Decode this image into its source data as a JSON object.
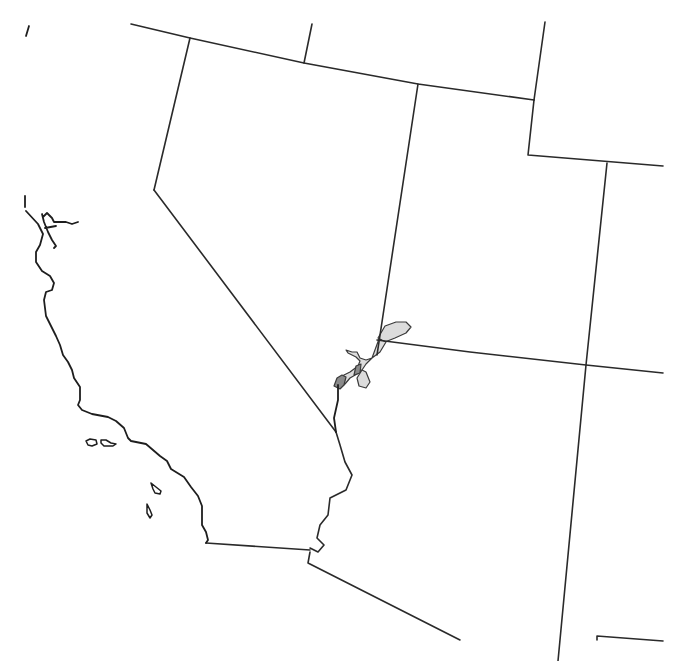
{
  "map": {
    "title": "",
    "width": 679,
    "height": 661,
    "colors": {
      "background": "#ffffff",
      "border": "#2a2a2a",
      "range_light": "#dcdcdc",
      "range_dark": "#8a8a8a"
    },
    "layers": {
      "state_borders": [
        {
          "name": "northern-border-line",
          "d": "M131,24 L190,38 L304,63 L418,84 L534,100"
        },
        {
          "name": "oregon-idaho-border",
          "d": "M312,24 L304,63"
        },
        {
          "name": "idaho-wyoming-border",
          "d": "M545,22 L534,100"
        },
        {
          "name": "california-nevada-north-border",
          "d": "M190,38 L154,190"
        },
        {
          "name": "california-nevada-diagonal-border",
          "d": "M154,190 L336,432"
        },
        {
          "name": "nevada-utah-border",
          "d": "M418,84 L377,355"
        },
        {
          "name": "utah-wyoming-border",
          "d": "M534,100 L528,155 L663,166"
        },
        {
          "name": "utah-colorado-border",
          "d": "M607,163 L586,365 L558,661"
        },
        {
          "name": "arizona-utah-border",
          "d": "M377,340 L470,352 L586,365 L663,373"
        },
        {
          "name": "california-arizona-border",
          "d": "M336,432 L340,445 L345,462 L352,475 L346,490 L330,498 L328,515 L320,525 L317,538 L324,545 L318,552 L310,548"
        },
        {
          "name": "california-mexico-border",
          "d": "M206,543 L310,550"
        },
        {
          "name": "arizona-mexico-border",
          "d": "M310,552 L308,563 L460,640"
        },
        {
          "name": "new-mexico-mexico-border",
          "d": "M597,640 L597,636 L663,641"
        }
      ],
      "coastline": [
        {
          "name": "northern-tip-fragment",
          "d": "M29,26 L26,36"
        },
        {
          "name": "north-coast-fragment",
          "d": "M25,196 L25,207"
        },
        {
          "name": "bay-area-coast",
          "d": "M26,211 L38,224 L43,234 L40,245 L36,252 L36,262 L42,271 L50,276 L54,283 L52,290 L46,292 L44,300 L46,316 L56,336 L60,345 L63,355 L68,362 L72,370 L74,378 L80,387 L80,400 L78,405 L82,410 L92,414 L108,417 L116,421 L124,428 L128,438 L131,441 L146,444 L160,456 L167,461 L171,469 L184,477 L191,487 L198,496 L202,506 L202,525 L206,532 L208,540 L206,543"
        },
        {
          "name": "san-francisco-bay",
          "d": "M42,214 L44,222 L48,232 L52,240 L56,246 L54,248 M43,217 L47,213 L52,218 L54,222 L66,222 L72,224 L78,222 M45,228 L56,226"
        },
        {
          "name": "lower-colorado-river-boundary",
          "d": "M336,432 L334,418 L338,400 L338,385"
        }
      ],
      "islands": [
        {
          "name": "channel-island-santa-rosa",
          "d": "M86,441 L90,439 L96,440 L97,444 L92,446 L88,445 Z"
        },
        {
          "name": "channel-island-santa-cruz",
          "d": "M101,440 L106,440 L111,443 L116,444 L113,446 L104,446 L101,443 Z"
        },
        {
          "name": "channel-island-santa-catalina",
          "d": "M151,483 L156,487 L161,491 L160,494 L155,493 L153,489 Z"
        },
        {
          "name": "channel-island-san-clemente",
          "d": "M147,504 L150,510 L152,515 L150,518 L147,513 Z"
        }
      ],
      "range_areas": [
        {
          "name": "range-lake-mead-lobe",
          "class": "range-light",
          "d": "M378,338 L385,326 L396,322 L406,322 L411,327 L406,333 L395,338 L385,342 Z"
        },
        {
          "name": "range-colorado-river-upper",
          "class": "range-light",
          "d": "M379,339 L386,342 L380,352 L372,358 L366,360 L360,358 L357,352 L352,352 L346,350 L348,353 L356,357 L360,361 L358,366 L350,372 L344,375 L340,379 L338,383 L341,387 L345,384 L350,378 L357,374 L362,370 L366,364 L372,358 Z"
        },
        {
          "name": "range-colorado-river-dark-segment",
          "class": "range-dark",
          "d": "M356,366 L361,364 L360,373 L354,375 Z"
        },
        {
          "name": "range-colorado-river-dark-bend",
          "class": "range-dark",
          "d": "M337,378 L342,375 L346,377 L344,385 L340,389 L334,386 Z"
        },
        {
          "name": "range-nevada-tip-outline",
          "class": "range-light",
          "d": "M362,370 L366,372 L370,382 L366,388 L359,386 L357,378 Z"
        }
      ]
    }
  }
}
